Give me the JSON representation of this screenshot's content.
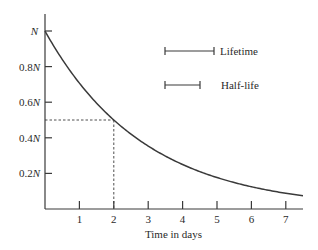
{
  "chart_data": {
    "type": "line",
    "title": "",
    "xlabel": "Time in days",
    "ylabel": "",
    "xlim": [
      0,
      7.5
    ],
    "ylim": [
      0,
      1
    ],
    "x_ticks": [
      1,
      2,
      3,
      4,
      5,
      6,
      7
    ],
    "x_tick_labels": [
      "1",
      "2",
      "3",
      "4",
      "5",
      "6",
      "7"
    ],
    "y_ticks": [
      0.2,
      0.4,
      0.6,
      0.8,
      1.0
    ],
    "y_tick_labels": [
      "0.2N",
      "0.4N",
      "0.6N",
      "0.8N",
      "N"
    ],
    "grid": false,
    "series": [
      {
        "name": "N(t) exponential decay",
        "half_life_days": 2,
        "x": [
          0,
          0.5,
          1,
          1.5,
          2,
          2.5,
          3,
          3.5,
          4,
          4.5,
          5,
          5.5,
          6,
          6.5,
          7,
          7.5
        ],
        "values": [
          1.0,
          0.841,
          0.707,
          0.595,
          0.5,
          0.42,
          0.354,
          0.297,
          0.25,
          0.21,
          0.177,
          0.149,
          0.125,
          0.105,
          0.088,
          0.074
        ]
      }
    ],
    "annotations": [
      {
        "type": "dashed-guide",
        "x": 2,
        "y": 0.5,
        "note": "half-life marker: N/2 at t = 2 days"
      }
    ],
    "legend": {
      "position": "upper-right",
      "entries": [
        {
          "label": "Lifetime",
          "bar_relative_length": 1.443
        },
        {
          "label": "Half-life",
          "bar_relative_length": 1.0
        }
      ]
    }
  },
  "labels": {
    "y_top": "N",
    "y_08": "0.8N",
    "y_06": "0.6N",
    "y_04": "0.4N",
    "y_02": "0.2N",
    "x1": "1",
    "x2": "2",
    "x3": "3",
    "x4": "4",
    "x5": "5",
    "x6": "6",
    "x7": "7",
    "xlabel": "Time in days",
    "legend_lifetime": "Lifetime",
    "legend_halflife": "Half-life"
  }
}
